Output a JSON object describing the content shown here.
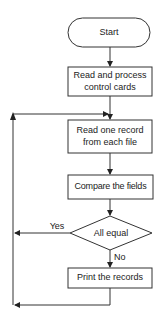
{
  "flowchart": {
    "nodes": [
      {
        "id": "start",
        "type": "terminator",
        "label": "Start"
      },
      {
        "id": "read_control",
        "type": "process",
        "line1": "Read and process",
        "line2": "control cards"
      },
      {
        "id": "read_record",
        "type": "process",
        "line1": "Read one record",
        "line2": "from each file"
      },
      {
        "id": "compare",
        "type": "process",
        "label": "Compare the fields"
      },
      {
        "id": "all_equal",
        "type": "decision",
        "label": "All equal"
      },
      {
        "id": "print",
        "type": "process",
        "label": "Print the records"
      }
    ],
    "edges": {
      "yes_label": "Yes",
      "no_label": "No"
    }
  }
}
